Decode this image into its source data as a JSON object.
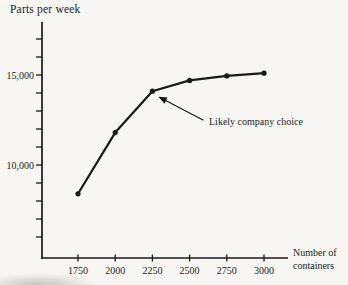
{
  "chart_data": {
    "type": "line",
    "title": "",
    "ylabel": "Parts per week",
    "xlabel": "Number of containers",
    "x": [
      1750,
      2000,
      2250,
      2500,
      2750,
      3000
    ],
    "values": [
      8400,
      11800,
      14100,
      14700,
      14950,
      15100
    ],
    "xtick_labels": [
      "1750",
      "2000",
      "2250",
      "2500",
      "2750",
      "3000"
    ],
    "ytick_major": [
      {
        "label": "15,000",
        "value": 15000
      },
      {
        "label": "10,000",
        "value": 10000
      }
    ],
    "ytick_minor_values": [
      17000,
      16000,
      15000,
      14000,
      13000,
      12000,
      11000,
      10000,
      9000,
      8000,
      7000,
      6000
    ],
    "xlim": [
      1510,
      3160
    ],
    "ylim": [
      4800,
      17900
    ],
    "grid": false,
    "legend": null,
    "marker": "circle",
    "line_color": "#1a1916",
    "annotation": {
      "text": "Likely company choice",
      "target_x": 2250,
      "target_y": 14100
    }
  },
  "colors": {
    "background": "#f7f6f2",
    "ink": "#1a1916",
    "text": "#201e1b"
  }
}
